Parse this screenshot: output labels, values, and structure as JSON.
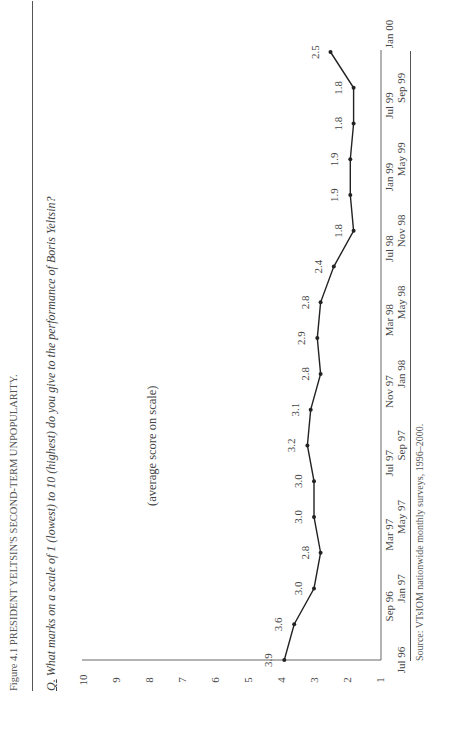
{
  "figure": {
    "title": "Figure 4.1 PRESIDENT YELTSIN'S SECOND-TERM UNPOPULARITY.",
    "question_prefix": "Q.",
    "question": "What marks on a scale of 1 (lowest) to 10 (highest) do you give to the performance of Boris Yeltsin?",
    "y_axis_label": "(average score on scale)",
    "source": "Source: VTsIOM nationwide monthly surveys, 1996–2000."
  },
  "chart_data": {
    "type": "line",
    "title": "President Yeltsin's Second-Term Unpopularity",
    "xlabel": "",
    "ylabel": "(average score on scale)",
    "ylim": [
      1,
      10
    ],
    "yticks": [
      1,
      2,
      3,
      4,
      5,
      6,
      7,
      8,
      9,
      10
    ],
    "grid": false,
    "legend": null,
    "categories": [
      "Jul 96",
      "Sep 96",
      "Jan 97",
      "Mar 97",
      "May 97",
      "Jul 97",
      "Sep 97",
      "Nov 97",
      "Jan 98",
      "Mar 98",
      "May 98",
      "Jul 98",
      "Nov 98",
      "Jan 99",
      "May 99",
      "Jul 99",
      "Sep 99",
      "Jan 00"
    ],
    "values": [
      3.9,
      3.6,
      3.0,
      2.8,
      3.0,
      3.0,
      3.2,
      3.1,
      2.8,
      2.9,
      2.8,
      2.4,
      1.8,
      1.9,
      1.9,
      1.8,
      1.8,
      2.5
    ],
    "value_labels": [
      "3.9",
      "3.6",
      "3.0",
      "2.8",
      "3.0",
      "3.0",
      "3.2",
      "3.1",
      "2.8",
      "2.9",
      "2.8",
      "2.4",
      "1.8",
      "1.9",
      "1.9",
      "1.8",
      "1.8",
      "2.5"
    ]
  }
}
